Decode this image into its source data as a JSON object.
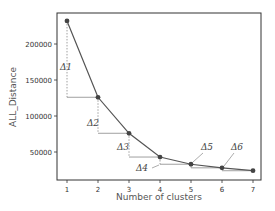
{
  "chart_data": {
    "type": "line",
    "title": "",
    "xlabel": "Number of clusters",
    "ylabel": "ALL_Distance",
    "x": [
      1,
      2,
      3,
      4,
      5,
      6,
      7
    ],
    "series": [
      {
        "name": "ALL_Distance",
        "values": [
          232000,
          126000,
          76000,
          43000,
          33000,
          28000,
          24000
        ]
      }
    ],
    "xticks": [
      "1",
      "2",
      "3",
      "4",
      "5",
      "6",
      "7"
    ],
    "yticks": [
      "50000",
      "100000",
      "150000",
      "200000"
    ],
    "ylim": [
      10000,
      245000
    ],
    "xlim": [
      0.7,
      7.3
    ],
    "grid": false,
    "annotations": [
      {
        "label": "Δ1",
        "between": [
          1,
          2
        ]
      },
      {
        "label": "Δ2",
        "between": [
          2,
          3
        ]
      },
      {
        "label": "Δ3",
        "between": [
          3,
          4
        ]
      },
      {
        "label": "Δ4",
        "between": [
          4,
          5
        ]
      },
      {
        "label": "Δ5",
        "between": [
          5,
          6
        ]
      },
      {
        "label": "Δ6",
        "between": [
          6,
          7
        ]
      }
    ],
    "colors": {
      "line": "#555555",
      "marker": "#444444",
      "frame": "#333333",
      "guide": "#888888"
    }
  }
}
